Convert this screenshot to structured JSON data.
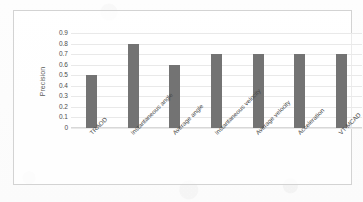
{
  "chart_data": {
    "type": "bar",
    "title": "",
    "xlabel": "",
    "ylabel": "Precision",
    "categories": [
      "TRAOD",
      "Instantaneous angle",
      "Average angle",
      "Instantaneous velocity",
      "Average velocity",
      "Acceleration",
      "VT-MCAD"
    ],
    "values": [
      0.5,
      0.8,
      0.6,
      0.7,
      0.7,
      0.7,
      0.7
    ],
    "ylim": [
      0,
      0.9
    ],
    "ytick_labels": [
      "0.9",
      "0.8",
      "0.7",
      "0.6",
      "0.5",
      "0.4",
      "0.3",
      "0.2",
      "0.1",
      "0"
    ],
    "ytick_values": [
      0.9,
      0.8,
      0.7,
      0.6,
      0.5,
      0.4,
      0.3,
      0.2,
      0.1,
      0
    ],
    "grid": true,
    "legend": false,
    "legend_position": "none",
    "series": [
      {
        "name": "Precision",
        "values": [
          0.5,
          0.8,
          0.6,
          0.7,
          0.7,
          0.7,
          0.7
        ]
      }
    ],
    "colors": {
      "bar": "#737373",
      "gridline": "#e9e9e9",
      "axis": "#d8d8d8",
      "border": "#d3d3d3",
      "text": "#4a4a4a",
      "background": "#ffffff"
    }
  }
}
